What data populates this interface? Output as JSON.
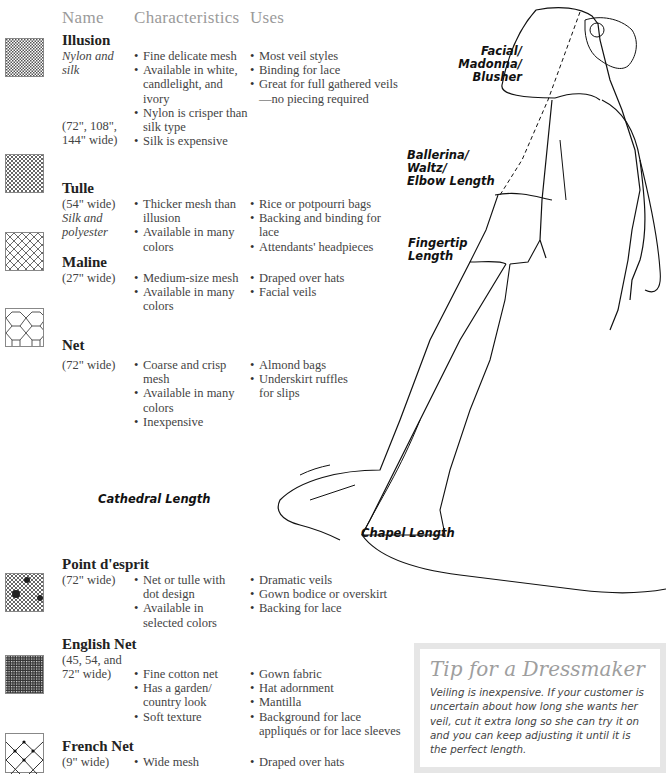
{
  "headers": {
    "name": "Name",
    "characteristics": "Characteristics",
    "uses": "Uses"
  },
  "fabrics": [
    {
      "name": "Illusion",
      "material": "Nylon and\nsilk",
      "width": "(72\", 108\",\n144\" wide)",
      "swatch_icon": "fine-mesh-swatch",
      "characteristics": [
        "Fine delicate mesh",
        "Available in white, candlelight, and ivory",
        "Nylon is crisper than silk type",
        "Silk is expensive"
      ],
      "uses": [
        "Most veil styles",
        "Binding for lace",
        "Great for full gathered veils—no piecing required"
      ]
    },
    {
      "name": "Tulle",
      "width": "(54\" wide)",
      "material": "Silk and\npolyester",
      "swatch_icon": "tulle-mesh-swatch",
      "characteristics": [
        "Thicker mesh than illusion",
        "Available in many colors"
      ],
      "uses": [
        "Rice or potpourri bags",
        "Backing and binding for lace",
        "Attendants' headpieces"
      ]
    },
    {
      "name": "Maline",
      "width": "(27\" wide)",
      "swatch_icon": "maline-mesh-swatch",
      "characteristics": [
        "Medium-size mesh",
        "Available in many colors"
      ],
      "uses": [
        "Draped over hats",
        "Facial veils"
      ]
    },
    {
      "name": "Net",
      "width": "(72\" wide)",
      "swatch_icon": "hexagon-net-swatch",
      "characteristics": [
        "Coarse and crisp mesh",
        "Available in many colors",
        "Inexpensive"
      ],
      "uses": [
        "Almond bags",
        "Underskirt ruffles for slips"
      ]
    },
    {
      "name": "Point d'esprit",
      "width": "(72\" wide)",
      "swatch_icon": "dotted-net-swatch",
      "characteristics": [
        "Net or tulle with dot design",
        "Available in selected colors"
      ],
      "uses": [
        "Dramatic veils",
        "Gown bodice or overskirt",
        "Backing for lace"
      ]
    },
    {
      "name": "English Net",
      "width": "(45, 54, and\n72\" wide)",
      "swatch_icon": "english-net-swatch",
      "characteristics": [
        "Fine cotton net",
        "Has a garden/ country look",
        "Soft texture"
      ],
      "uses": [
        "Gown fabric",
        "Hat adornment",
        "Mantilla",
        "Background for lace appliqués or for lace sleeves"
      ]
    },
    {
      "name": "French Net",
      "width": "(9\" wide)",
      "swatch_icon": "french-net-swatch",
      "characteristics": [
        "Wide mesh"
      ],
      "uses": [
        "Draped over hats"
      ]
    }
  ],
  "veil_lengths": {
    "facial": "Facial/\nMadonna/\nBlusher",
    "ballerina": "Ballerina/\nWaltz/\nElbow Length",
    "fingertip": "Fingertip\nLength",
    "cathedral": "Cathedral Length",
    "chapel": "Chapel Length"
  },
  "tip": {
    "title": "Tip for a Dressmaker",
    "body": "Veiling is inexpensive. If your customer is uncertain about how long she wants her veil, cut it extra long so she can try it on and you can keep adjusting it until it is the perfect length."
  }
}
